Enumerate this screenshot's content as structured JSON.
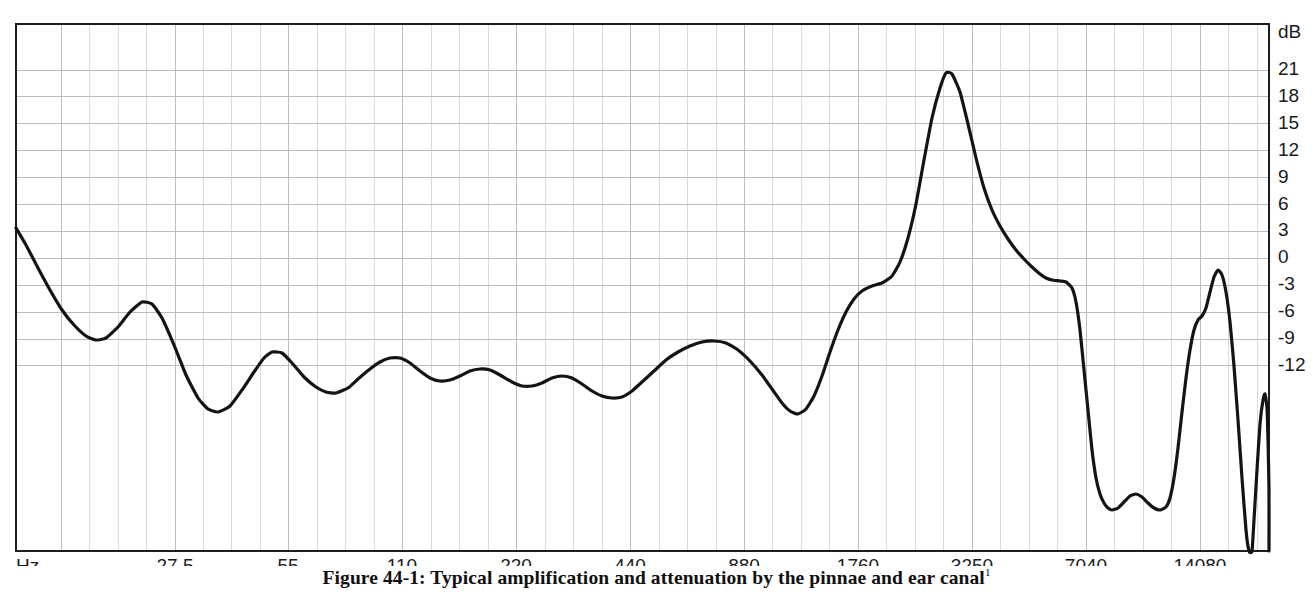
{
  "figure": {
    "caption": "Figure 44-1: Typical amplification and attenuation by the pinnae and ear canal",
    "caption_footnote_marker": "1"
  },
  "chart_data": {
    "type": "line",
    "title": "Typical amplification and attenuation by the pinnae and ear canal",
    "xlabel": "Hz",
    "ylabel": "dB",
    "x_axis_unit_label": "Hz",
    "y_axis_unit_label": "dB",
    "x_scale": "log",
    "grid": true,
    "legend": "none",
    "x_tick_labels": [
      "27.5",
      "55",
      "110",
      "220",
      "440",
      "880",
      "1760",
      "3250",
      "7040",
      "14080"
    ],
    "x_tick_values": [
      27.5,
      55,
      110,
      220,
      440,
      880,
      1760,
      3250,
      7040,
      14080
    ],
    "y_tick_labels": [
      "21",
      "18",
      "15",
      "12",
      "9",
      "6",
      "3",
      "0",
      "-3",
      "-6",
      "-9",
      "-12"
    ],
    "y_tick_values": [
      21,
      18,
      15,
      12,
      9,
      6,
      3,
      0,
      -3,
      -6,
      -9,
      -12
    ],
    "ylim": [
      -12,
      22.5
    ],
    "xlim_px_fraction": [
      0.0,
      1.0
    ],
    "series": [
      {
        "name": "Pinnae and ear canal response",
        "color": "#141414",
        "points_px": [
          [
            16,
            228
          ],
          [
            26,
            245
          ],
          [
            38,
            268
          ],
          [
            50,
            290
          ],
          [
            62,
            310
          ],
          [
            74,
            325
          ],
          [
            86,
            336
          ],
          [
            96,
            340
          ],
          [
            106,
            338
          ],
          [
            118,
            327
          ],
          [
            130,
            312
          ],
          [
            142,
            302
          ],
          [
            152,
            304
          ],
          [
            162,
            318
          ],
          [
            174,
            345
          ],
          [
            186,
            375
          ],
          [
            198,
            398
          ],
          [
            208,
            409
          ],
          [
            218,
            412
          ],
          [
            230,
            406
          ],
          [
            242,
            390
          ],
          [
            254,
            372
          ],
          [
            264,
            358
          ],
          [
            272,
            352
          ],
          [
            282,
            353
          ],
          [
            292,
            363
          ],
          [
            304,
            377
          ],
          [
            316,
            387
          ],
          [
            326,
            392
          ],
          [
            336,
            393
          ],
          [
            348,
            388
          ],
          [
            358,
            379
          ],
          [
            370,
            369
          ],
          [
            380,
            362
          ],
          [
            390,
            358
          ],
          [
            400,
            358
          ],
          [
            410,
            363
          ],
          [
            420,
            371
          ],
          [
            430,
            378
          ],
          [
            440,
            381
          ],
          [
            450,
            380
          ],
          [
            460,
            376
          ],
          [
            470,
            371
          ],
          [
            480,
            369
          ],
          [
            490,
            370
          ],
          [
            500,
            375
          ],
          [
            512,
            382
          ],
          [
            522,
            386
          ],
          [
            532,
            386
          ],
          [
            542,
            383
          ],
          [
            552,
            378
          ],
          [
            562,
            376
          ],
          [
            572,
            378
          ],
          [
            582,
            384
          ],
          [
            592,
            391
          ],
          [
            602,
            396
          ],
          [
            612,
            398
          ],
          [
            622,
            397
          ],
          [
            632,
            391
          ],
          [
            642,
            382
          ],
          [
            654,
            371
          ],
          [
            666,
            360
          ],
          [
            678,
            352
          ],
          [
            690,
            346
          ],
          [
            702,
            342
          ],
          [
            714,
            341
          ],
          [
            726,
            343
          ],
          [
            738,
            350
          ],
          [
            750,
            361
          ],
          [
            762,
            375
          ],
          [
            772,
            389
          ],
          [
            782,
            403
          ],
          [
            790,
            411
          ],
          [
            798,
            414
          ],
          [
            806,
            409
          ],
          [
            814,
            396
          ],
          [
            822,
            376
          ],
          [
            830,
            352
          ],
          [
            838,
            330
          ],
          [
            846,
            312
          ],
          [
            854,
            299
          ],
          [
            862,
            291
          ],
          [
            872,
            286
          ],
          [
            882,
            283
          ],
          [
            892,
            276
          ],
          [
            900,
            262
          ],
          [
            908,
            238
          ],
          [
            916,
            204
          ],
          [
            924,
            160
          ],
          [
            932,
            118
          ],
          [
            940,
            88
          ],
          [
            946,
            73
          ],
          [
            952,
            74
          ],
          [
            960,
            92
          ],
          [
            968,
            124
          ],
          [
            976,
            158
          ],
          [
            984,
            188
          ],
          [
            992,
            210
          ],
          [
            1000,
            226
          ],
          [
            1008,
            239
          ],
          [
            1016,
            250
          ],
          [
            1024,
            259
          ],
          [
            1032,
            267
          ],
          [
            1040,
            274
          ],
          [
            1046,
            278
          ],
          [
            1052,
            280
          ],
          [
            1060,
            281
          ],
          [
            1066,
            282
          ],
          [
            1072,
            288
          ],
          [
            1076,
            302
          ],
          [
            1080,
            330
          ],
          [
            1084,
            370
          ],
          [
            1088,
            410
          ],
          [
            1092,
            450
          ],
          [
            1096,
            478
          ],
          [
            1100,
            494
          ],
          [
            1104,
            503
          ],
          [
            1108,
            508
          ],
          [
            1112,
            510
          ],
          [
            1118,
            508
          ],
          [
            1124,
            502
          ],
          [
            1130,
            496
          ],
          [
            1136,
            494
          ],
          [
            1142,
            497
          ],
          [
            1148,
            503
          ],
          [
            1154,
            508
          ],
          [
            1160,
            510
          ],
          [
            1166,
            507
          ],
          [
            1170,
            498
          ],
          [
            1174,
            478
          ],
          [
            1178,
            448
          ],
          [
            1182,
            412
          ],
          [
            1186,
            378
          ],
          [
            1190,
            350
          ],
          [
            1194,
            330
          ],
          [
            1198,
            320
          ],
          [
            1202,
            316
          ],
          [
            1206,
            308
          ],
          [
            1210,
            292
          ],
          [
            1214,
            277
          ],
          [
            1218,
            270
          ],
          [
            1222,
            275
          ],
          [
            1226,
            292
          ],
          [
            1230,
            322
          ],
          [
            1234,
            366
          ],
          [
            1238,
            420
          ],
          [
            1242,
            478
          ],
          [
            1246,
            530
          ],
          [
            1249,
            551
          ],
          [
            1252,
            551
          ],
          [
            1254,
            520
          ],
          [
            1257,
            470
          ],
          [
            1260,
            424
          ],
          [
            1263,
            400
          ],
          [
            1265,
            394
          ],
          [
            1267,
            408
          ],
          [
            1268,
            440
          ],
          [
            1269,
            490
          ],
          [
            1269,
            551
          ]
        ],
        "annotations": [
          {
            "label": "start level",
            "hz": 20,
            "db": 10.2
          },
          {
            "label": "first dip",
            "hz": 34,
            "db": 2.3
          },
          {
            "label": "local peak",
            "hz": 43,
            "db": 4.3
          },
          {
            "label": "low trough",
            "hz": 68,
            "db": -3.1
          },
          {
            "label": "midband ripple high",
            "hz": 150,
            "db": 1.6
          },
          {
            "label": "midband ripple low",
            "hz": 300,
            "db": -1.4
          },
          {
            "label": "pre-resonance bump",
            "hz": 660,
            "db": 2.1
          },
          {
            "label": "pre-resonance dip",
            "hz": 1020,
            "db": -3.0
          },
          {
            "label": "shoulder",
            "hz": 1900,
            "db": 6.8
          },
          {
            "label": "main resonance peak",
            "hz": 2900,
            "db": 20.5
          },
          {
            "label": "plateau before cutoff",
            "hz": 6800,
            "db": 6.8
          },
          {
            "label": "deep notch",
            "hz": 8300,
            "db": -9.6
          },
          {
            "label": "notch sub-bump",
            "hz": 9200,
            "db": -8.7
          },
          {
            "label": "second notch",
            "hz": 10100,
            "db": -9.6
          },
          {
            "label": "secondary peak",
            "hz": 13200,
            "db": 7.0
          },
          {
            "label": "final narrow peak",
            "hz": 18500,
            "db": -2.0
          }
        ]
      }
    ]
  },
  "plot_geometry": {
    "left_px": 16,
    "right_px": 1269,
    "top_px": 24,
    "bottom_px": 551,
    "y_db_top": 22.5,
    "y_db_bottom": -12.0,
    "x_tick_px": [
      175,
      288,
      402,
      516,
      630,
      744,
      858,
      972,
      1086,
      1200
    ],
    "y_tick_px": [
      70,
      96.9,
      123.8,
      150.7,
      177.6,
      204.5,
      231.4,
      258.3,
      285.2,
      312.1,
      339,
      365.9
    ],
    "major_grid_step_x_px": 113.9,
    "minor_grid_per_major_x": 4,
    "y_grid_step_px": 44.2
  },
  "colors": {
    "curve": "#141414",
    "grid_major": "#b9bcc0",
    "grid_minor": "#d8dade",
    "frame": "#1d1d1d",
    "text": "#1a1a1a",
    "background": "#ffffff"
  }
}
